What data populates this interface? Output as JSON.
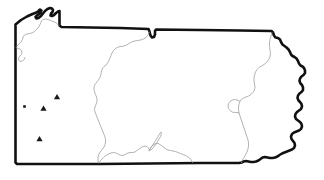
{
  "figure": {
    "kind": "map",
    "region_name": "Pennsylvania",
    "background_color": "#ffffff",
    "outline_color": "#111111",
    "interior_line_color": "#9a9a9a",
    "marker_color": "#181818",
    "width_px": 324,
    "height_px": 180
  },
  "map": {
    "outline_name": "pennsylvania-state-outline",
    "outline_path": "M 15.5 24.5 L 21.0 20.0 L 27.0 16.5 L 32.5 14.0 L 36.5 12.5 L 38.5 11.0 L 40.0 9.5 L 41.5 10.5 L 40.5 12.5 L 39.0 14.0 L 37.0 15.5 L 35.5 17.0 L 36.5 18.5 L 38.5 18.0 L 41.0 16.0 L 43.0 13.5 L 45.0 11.0 L 47.5 9.0 L 50.0 8.0 L 52.0 8.5 L 53.0 10.0 L 52.5 12.0 L 51.0 13.5 L 50.5 15.5 L 52.0 16.0 L 54.0 15.0 L 56.0 13.0 L 58.0 11.5 L 59.5 11.0 L 59.5 17.5 L 59.5 25.5 L 61.5 27.0 L 120.0 28.0 L 148.5 29.0 L 149.5 31.5 L 150.5 35.5 L 152.0 37.5 L 154.0 37.0 L 155.0 34.5 L 155.0 31.0 L 156.0 29.5 L 200.0 30.0 L 240.0 30.5 L 271.5 31.0 L 273.0 32.5 L 274.0 35.5 L 275.5 37.5 L 278.0 38.0 L 280.0 39.5 L 281.0 42.0 L 282.5 44.5 L 284.5 46.0 L 286.5 47.5 L 288.5 49.5 L 290.0 52.0 L 291.0 54.5 L 292.5 56.0 L 294.5 57.0 L 296.5 58.5 L 298.0 61.0 L 299.0 63.5 L 300.5 65.5 L 302.5 66.5 L 304.0 68.0 L 305.0 70.5 L 305.0 73.0 L 303.5 75.0 L 301.5 76.5 L 300.0 78.5 L 299.5 81.0 L 300.5 83.5 L 302.0 85.0 L 303.0 87.5 L 303.0 90.0 L 301.5 92.0 L 299.5 93.5 L 298.0 95.5 L 297.5 98.0 L 298.5 100.5 L 300.0 102.0 L 301.5 104.0 L 302.0 106.5 L 301.0 109.0 L 299.0 110.5 L 297.0 112.0 L 295.5 114.0 L 295.0 116.5 L 296.0 119.0 L 298.0 120.5 L 300.0 122.0 L 301.5 124.0 L 302.0 126.5 L 301.0 129.0 L 299.0 130.5 L 296.5 131.5 L 294.0 132.5 L 292.0 134.0 L 291.0 136.5 L 291.5 139.0 L 293.0 141.0 L 294.5 143.0 L 295.0 145.5 L 294.0 148.0 L 292.0 149.5 L 289.5 150.5 L 287.0 151.5 L 284.5 152.5 L 282.0 153.5 L 279.5 155.0 L 277.5 156.5 L 275.0 157.5 L 272.5 158.0 L 270.0 158.0 L 267.5 157.5 L 265.0 157.0 L 262.5 157.5 L 260.5 159.0 L 258.5 160.5 L 256.0 161.5 L 253.5 162.0 L 251.0 162.0 L 248.5 161.5 L 246.0 161.0 L 243.5 161.5 L 241.5 162.5 L 239.0 163.0 L 200.0 163.0 L 150.0 163.5 L 100.0 164.0 L 50.0 164.0 L 17.0 164.0 L 15.5 162.5 L 15.5 120.0 L 15.5 70.0 Z",
    "interior_lines": [
      {
        "name": "lake-erie-county-boundary",
        "path": "M 17.0 46.0 L 19.0 44.0 L 21.0 42.0 L 22.5 39.5 L 23.0 37.0 L 24.5 35.0 L 27.0 34.0 L 29.5 33.5 L 32.0 33.0 L 34.5 31.5 L 37.0 29.0 L 39.0 26.5 L 40.5 23.5 L 41.5 21.0 L 43.0 19.5 L 45.5 19.0 L 48.0 19.5 L 50.5 20.5 L 53.0 21.5 L 55.5 22.5 L 57.5 24.0 L 59.0 25.5"
      },
      {
        "name": "erie-county-south-line",
        "path": "M 16.0 47.5 L 18.0 48.5 L 20.0 49.0 L 21.5 50.5 L 22.0 53.0 L 21.0 55.0 L 19.5 56.5 L 18.5 58.5 L 19.0 60.5 L 20.5 61.5 L 22.5 61.0 L 24.0 59.5 L 25.0 57.5"
      },
      {
        "name": "allegheny-susquehanna-divide",
        "path": "M 149.5 32.0 L 148.0 35.0 L 146.0 37.5 L 143.5 39.0 L 140.5 40.0 L 137.5 40.5 L 134.5 41.0 L 131.5 42.0 L 129.0 43.5 L 126.5 45.0 L 124.0 46.0 L 121.0 46.5 L 118.0 47.0 L 115.5 48.5 L 113.5 50.5 L 112.0 53.0 L 111.0 55.5 L 110.0 58.0 L 109.0 60.5 L 107.5 63.0 L 106.0 65.0 L 104.0 66.5 L 102.5 68.5 L 101.5 71.0 L 101.0 73.5 L 100.5 76.0 L 99.5 78.5 L 98.0 80.5 L 96.5 82.5 L 95.0 84.5 L 94.0 87.0 L 94.0 89.5 L 94.5 92.0 L 95.5 94.5 L 96.5 97.0 L 97.0 99.5 L 97.0 102.0 L 96.0 104.5 L 95.0 107.0 L 94.5 109.5 L 95.0 112.0 L 96.0 114.5 L 97.0 117.0 L 98.0 119.5 L 99.0 122.0 L 100.0 124.5 L 101.0 127.0 L 102.0 129.5 L 103.0 132.0 L 104.0 134.5 L 105.0 137.0 L 105.5 139.5 L 105.5 142.0 L 105.0 144.5 L 104.0 147.0 L 102.5 149.0 L 101.0 151.0 L 99.5 153.0 L 98.5 155.5 L 98.0 158.0 L 98.0 160.5 L 98.5 163.0"
      },
      {
        "name": "south-central-ridge-line",
        "path": "M 99.0 162.5 L 101.0 160.0 L 103.5 157.5 L 106.0 155.5 L 108.5 154.0 L 111.0 153.0 L 113.5 152.5 L 116.0 153.0 L 118.0 154.0 L 120.0 155.0 L 122.0 155.5 L 124.0 155.0 L 126.0 154.0 L 128.0 153.0 L 130.0 152.5 L 132.5 152.5 L 135.0 152.0 L 137.0 150.5 L 139.0 149.0 L 141.0 147.5 L 143.0 146.5 L 145.0 146.0 L 147.0 146.5 L 148.5 148.0 L 149.5 150.0 L 150.5 148.0 L 152.0 146.0 L 154.0 144.5 L 156.0 143.5 L 158.0 143.5 L 160.0 144.5 L 162.0 146.0 L 164.0 147.5 L 166.0 149.0 L 168.0 150.0 L 170.5 150.5 L 173.0 151.0 L 175.5 151.5 L 178.0 152.5 L 180.5 153.5 L 183.0 154.5 L 185.5 155.5 L 188.0 157.0 L 190.0 158.5 L 191.5 160.5 L 192.5 162.5"
      },
      {
        "name": "juniata-inlet-line",
        "path": "M 149.0 150.5 L 152.0 146.0 L 155.0 141.5 L 157.5 137.5 L 159.5 134.0 L 161.0 132.0 L 161.5 133.5 L 160.5 136.5 L 158.5 140.0 L 156.0 144.0 L 153.5 147.5 L 151.0 150.0 Z"
      },
      {
        "name": "eastern-highlands-boundary",
        "path": "M 272.0 32.5 L 271.0 36.0 L 270.0 39.5 L 269.5 43.0 L 269.5 46.5 L 270.0 50.0 L 270.5 53.5 L 270.0 57.0 L 268.5 60.0 L 266.5 62.5 L 264.0 64.5 L 261.5 66.0 L 259.0 67.5 L 257.0 69.5 L 255.5 72.0 L 254.5 75.0 L 254.0 78.0 L 254.0 81.0 L 254.5 84.0 L 255.0 87.0 L 254.5 90.0 L 253.0 92.5 L 251.0 94.5 L 248.5 96.0 L 246.0 97.0 L 243.5 98.0 L 241.5 99.5 L 240.0 101.5 L 239.0 104.0 L 238.5 107.0 L 238.5 110.0 L 239.0 113.0 L 240.0 116.0 L 241.0 119.0 L 242.0 122.0 L 243.0 125.0 L 244.0 128.0 L 245.0 131.0 L 246.0 134.0 L 247.0 137.0 L 248.0 140.0 L 248.5 143.0 L 248.5 146.0 L 248.0 149.0 L 247.0 152.0 L 245.5 155.0 L 244.0 157.5 L 242.5 160.0 L 241.5 162.5"
      },
      {
        "name": "eastern-valley-inner-line",
        "path": "M 239.5 101.0 L 237.0 100.0 L 234.5 99.5 L 232.0 100.0 L 230.0 101.5 L 228.5 103.5 L 228.0 106.0 L 228.5 108.5 L 230.0 110.5 L 232.0 112.0 L 234.5 112.5 L 237.0 112.5 L 239.0 113.0"
      }
    ],
    "markers": [
      {
        "name": "marker-triangle-north",
        "shape": "triangle",
        "x": 57.0,
        "y": 97.0,
        "size": 5.0
      },
      {
        "name": "marker-triangle-middle",
        "shape": "triangle",
        "x": 43.5,
        "y": 108.5,
        "size": 5.0
      },
      {
        "name": "marker-square-west",
        "shape": "square",
        "x": 24.5,
        "y": 106.5,
        "size": 2.6
      },
      {
        "name": "marker-triangle-south",
        "shape": "triangle",
        "x": 39.5,
        "y": 139.0,
        "size": 5.0
      }
    ]
  }
}
